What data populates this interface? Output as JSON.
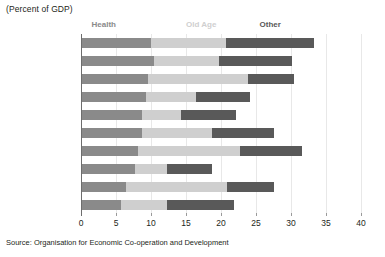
{
  "header": {
    "unit_note": "(Percent of GDP)"
  },
  "footer": {
    "source": "Source: Organisation for Economic Co-operation and Development"
  },
  "legend": {
    "items": [
      {
        "label": "Health",
        "color": "#8a8a8a",
        "x_value": 1.5
      },
      {
        "label": "Old Age",
        "color": "#cfcfcf",
        "x_value": 15.0
      },
      {
        "label": "Other",
        "color": "#595959",
        "x_value": 25.5
      }
    ]
  },
  "chart_data": {
    "type": "bar",
    "orientation": "horizontal",
    "stacked": true,
    "title": "",
    "subtitle": "(Percent of GDP)",
    "xlabel": "",
    "ylabel": "",
    "xlim": [
      0,
      40
    ],
    "xticks": [
      0,
      5,
      10,
      15,
      20,
      25,
      30,
      35,
      40
    ],
    "xtick_labels": [
      "0",
      "5",
      "10",
      "15",
      "20",
      "25",
      "30",
      "35",
      "40"
    ],
    "grid": true,
    "legend_position": "top",
    "categories": [
      "Belgium",
      "Norway",
      "France",
      "United Kingdom",
      "Australia",
      "Spain",
      "Italy",
      "Canada",
      "Greece",
      "Netherlands"
    ],
    "series": [
      {
        "name": "Health",
        "color": "#8a8a8a",
        "values": [
          10.0,
          10.4,
          9.6,
          9.3,
          8.7,
          8.7,
          8.1,
          7.7,
          6.4,
          5.7
        ]
      },
      {
        "name": "Old Age",
        "color": "#cfcfcf",
        "values": [
          10.7,
          9.3,
          14.3,
          7.1,
          5.6,
          10.0,
          14.6,
          4.6,
          14.5,
          6.6
        ]
      },
      {
        "name": "Other",
        "color": "#595959",
        "values": [
          12.6,
          10.4,
          6.5,
          7.7,
          7.8,
          8.9,
          8.9,
          6.4,
          6.7,
          9.6
        ]
      }
    ],
    "totals": [
      33.3,
      30.1,
      30.4,
      24.1,
      22.1,
      27.6,
      31.6,
      18.7,
      27.6,
      21.9
    ]
  }
}
